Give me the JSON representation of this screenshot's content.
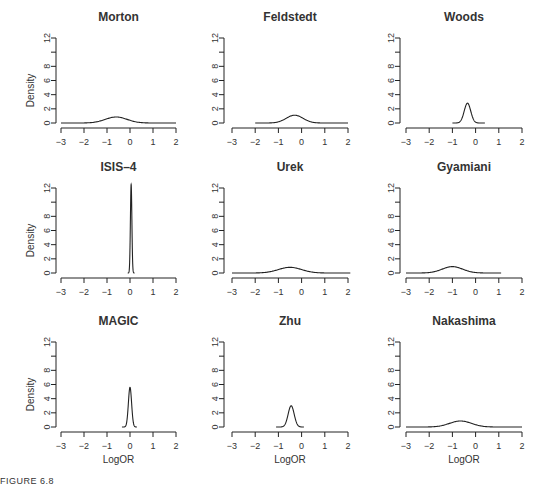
{
  "figure": {
    "caption": "FIGURE 6.8",
    "ylabel": "Density",
    "xlabel": "LogOR",
    "x_ticks": [
      -3,
      -2,
      -1,
      0,
      1,
      2
    ],
    "y_ticks": [
      0,
      2,
      4,
      6,
      8,
      10,
      12
    ],
    "y_tick_labels": [
      "0",
      "2",
      "4",
      "6",
      "8",
      "",
      "12"
    ]
  },
  "chart_data": {
    "type": "line",
    "xlabel": "LogOR",
    "ylabel": "Density",
    "xlim": [
      -3,
      2
    ],
    "ylim": [
      0,
      12
    ],
    "grid": false,
    "legend": null,
    "panels": [
      {
        "title": "Morton",
        "row": 0,
        "col": 0,
        "peak_x": -0.6,
        "peak_density": 0.85,
        "sd": 0.47,
        "x_range": [
          -3,
          2
        ],
        "show_ylabel": true,
        "show_xlabel": false
      },
      {
        "title": "Feldstedt",
        "row": 0,
        "col": 1,
        "peak_x": -0.3,
        "peak_density": 1.1,
        "sd": 0.36,
        "x_range": [
          -2,
          2
        ],
        "show_ylabel": false,
        "show_xlabel": false
      },
      {
        "title": "Woods",
        "row": 0,
        "col": 2,
        "peak_x": -0.35,
        "peak_density": 2.8,
        "sd": 0.14,
        "x_range": [
          -1,
          0.4
        ],
        "show_ylabel": false,
        "show_xlabel": false
      },
      {
        "title": "ISIS–4",
        "row": 1,
        "col": 0,
        "peak_x": 0.05,
        "peak_density": 12.5,
        "sd": 0.032,
        "x_range": [
          -0.1,
          0.2
        ],
        "show_ylabel": true,
        "show_xlabel": false
      },
      {
        "title": "Urek",
        "row": 1,
        "col": 1,
        "peak_x": -0.5,
        "peak_density": 0.8,
        "sd": 0.5,
        "x_range": [
          -3,
          2.1
        ],
        "show_ylabel": false,
        "show_xlabel": false
      },
      {
        "title": "Gyamiani",
        "row": 1,
        "col": 2,
        "peak_x": -1.0,
        "peak_density": 0.9,
        "sd": 0.44,
        "x_range": [
          -3,
          1.1
        ],
        "show_ylabel": false,
        "show_xlabel": false
      },
      {
        "title": "MAGIC",
        "row": 2,
        "col": 0,
        "peak_x": 0.0,
        "peak_density": 5.6,
        "sd": 0.07,
        "x_range": [
          -0.35,
          0.3
        ],
        "show_ylabel": true,
        "show_xlabel": true
      },
      {
        "title": "Zhu",
        "row": 2,
        "col": 1,
        "peak_x": -0.45,
        "peak_density": 3.0,
        "sd": 0.13,
        "x_range": [
          -1.1,
          0.1
        ],
        "show_ylabel": false,
        "show_xlabel": true
      },
      {
        "title": "Nakashima",
        "row": 2,
        "col": 2,
        "peak_x": -0.65,
        "peak_density": 0.85,
        "sd": 0.47,
        "x_range": [
          -3,
          2
        ],
        "show_ylabel": false,
        "show_xlabel": true
      }
    ]
  },
  "layout": {
    "col_axis_x": [
      56,
      224,
      400
    ],
    "col_x_min_px": [
      61,
      232,
      406
    ],
    "col_x_max_px": [
      176,
      348,
      522
    ],
    "row_y12_px": [
      38,
      188,
      342
    ],
    "row_y0_px": [
      123,
      273,
      427
    ],
    "line_color": "#222222"
  }
}
